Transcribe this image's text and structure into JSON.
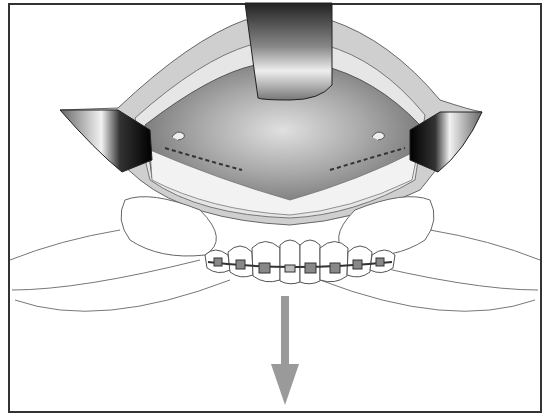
{
  "figure": {
    "colors": {
      "border": "#333333",
      "tissue_dark": "#6e6e6e",
      "tissue_mid": "#9a9a9a",
      "mucosa": "#c8c8c8",
      "arrow": "#9a9a9a",
      "outline": "#555555"
    },
    "elements": {
      "top_retractor": "retractor-top",
      "left_retractor": "retractor-left",
      "right_retractor": "retractor-right",
      "teeth": "upper-teeth-with-braces",
      "thumbs": "surgeon-thumbs",
      "arrow": "downward-arrow"
    },
    "tooth_count": 8
  }
}
